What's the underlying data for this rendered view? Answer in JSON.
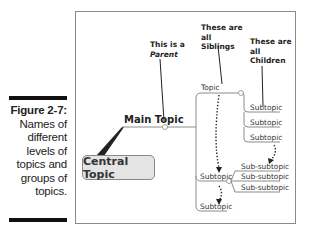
{
  "caption": {
    "figure_label": "Figure 2-7:",
    "lines": [
      "Names of",
      "different",
      "levels of",
      "topics and",
      "groups of",
      "topics."
    ]
  },
  "diagram": {
    "central_topic": "Central Topic",
    "main_topic": "Main Topic",
    "topic": "Topic",
    "subtopics_under_topic": [
      "Subtopic",
      "Subtopic",
      "Subtopic"
    ],
    "sibling_subtopic_middle": "Subtopic",
    "sibling_subtopic_bottom": "Subtopic",
    "sub_subtopics": [
      "Sub-subtopic",
      "Sub-subtopic",
      "Sub-subtopic"
    ],
    "notes": {
      "parent": {
        "line1": "This is a",
        "emphasis": "Parent"
      },
      "siblings": {
        "line1": "These are",
        "line2": "all",
        "line3": "Siblings"
      },
      "children": {
        "line1": "These are",
        "line2": "all",
        "line3": "Children"
      }
    }
  },
  "colors": {
    "line": "#8c8c8c",
    "callout": "#222222",
    "central_fill": "#e4e4e4",
    "caption_bar": "#111111"
  }
}
